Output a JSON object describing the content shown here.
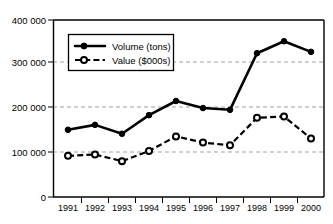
{
  "chart_data": {
    "type": "line",
    "title": "",
    "xlabel": "",
    "ylabel": "",
    "categories": [
      "1991",
      "1992",
      "1993",
      "1994",
      "1995",
      "1996",
      "1997",
      "1998",
      "1999",
      "2000"
    ],
    "series": [
      {
        "name": "Volume (tons)",
        "marker": "filled-circle",
        "linestyle": "solid",
        "color": "#000000",
        "values": [
          152000,
          163000,
          143000,
          185000,
          217000,
          201000,
          197000,
          325000,
          352000,
          328000
        ]
      },
      {
        "name": "Value ($000s)",
        "marker": "open-circle",
        "linestyle": "dashed",
        "color": "#000000",
        "values": [
          93000,
          96000,
          81000,
          104000,
          137000,
          123000,
          117000,
          179000,
          182000,
          132000
        ]
      }
    ],
    "ylim": [
      0,
      400000
    ],
    "yticks": [
      0,
      100000,
      200000,
      300000,
      400000
    ],
    "ytick_labels": [
      "0",
      "100 000",
      "200 000",
      "300 000",
      "400 000"
    ],
    "grid": true,
    "grid_axis": "y",
    "legend_position": "upper-left-inside"
  },
  "axes": {
    "y_ticks": [
      {
        "value": 400000,
        "label": "400 000"
      },
      {
        "value": 300000,
        "label": "300 000"
      },
      {
        "value": 200000,
        "label": "200 000"
      },
      {
        "value": 100000,
        "label": "100 000"
      },
      {
        "value": 0,
        "label": "0"
      }
    ],
    "x_ticks": [
      {
        "label": "1991"
      },
      {
        "label": "1992"
      },
      {
        "label": "1993"
      },
      {
        "label": "1994"
      },
      {
        "label": "1995"
      },
      {
        "label": "1996"
      },
      {
        "label": "1997"
      },
      {
        "label": "1998"
      },
      {
        "label": "1999"
      },
      {
        "label": "2000"
      }
    ]
  },
  "legend": {
    "items": [
      {
        "label": "Volume (tons)"
      },
      {
        "label": "Value ($000s)"
      }
    ]
  }
}
